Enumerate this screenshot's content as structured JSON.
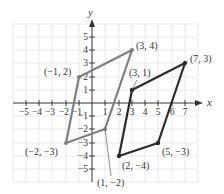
{
  "diagram": {
    "type": "coordinate-plane",
    "axes": {
      "x_label": "x",
      "y_label": "y",
      "x_ticks": [
        "−5",
        "−4",
        "−3",
        "−2",
        "−1",
        "1",
        "2",
        "3",
        "4",
        "5",
        "6",
        "7"
      ],
      "y_ticks": [
        "5",
        "4",
        "3",
        "2",
        "1",
        "−1",
        "−2",
        "−3",
        "−4",
        "−5"
      ]
    },
    "colors": {
      "grid": "#e3e3e3",
      "axis": "#333333",
      "shape_a": "#7f7f7f",
      "shape_b": "#2b2b2b"
    },
    "shapes": [
      {
        "name": "gray-parallelogram",
        "vertices": [
          [
            -1,
            2
          ],
          [
            3,
            4
          ],
          [
            1,
            -2
          ],
          [
            -2,
            -3
          ]
        ],
        "labels": [
          "(−1, 2)",
          "(3, 4)",
          "(1, −2)",
          "(−2, −3)"
        ]
      },
      {
        "name": "dark-parallelogram",
        "vertices": [
          [
            3,
            1
          ],
          [
            7,
            3
          ],
          [
            5,
            -3
          ],
          [
            2,
            -4
          ]
        ],
        "labels": [
          "(3, 1)",
          "(7, 3)",
          "(5, −3)",
          "(2, −4)"
        ]
      }
    ]
  },
  "labels": {
    "p_neg1_2": "(−1, 2)",
    "p_3_4": "(3, 4)",
    "p_1_neg2": "(1, −2)",
    "p_neg2_neg3": "(−2, −3)",
    "p_3_1": "(3, 1)",
    "p_7_3": "(7, 3)",
    "p_5_neg3": "(5, −3)",
    "p_2_neg4": "(2, −4)",
    "x_axis": "x",
    "y_axis": "y",
    "xt": {
      "m5": "−5",
      "m4": "−4",
      "m3": "−3",
      "m2": "−2",
      "m1": "−1",
      "p1": "1",
      "p2": "2",
      "p3": "3",
      "p4": "4",
      "p5": "5",
      "p6": "6",
      "p7": "7"
    },
    "yt": {
      "p5": "5",
      "p4": "4",
      "p3": "3",
      "p2": "2",
      "p1": "1",
      "m1": "−1",
      "m2": "−2",
      "m3": "−3",
      "m4": "−4",
      "m5": "−5"
    }
  }
}
